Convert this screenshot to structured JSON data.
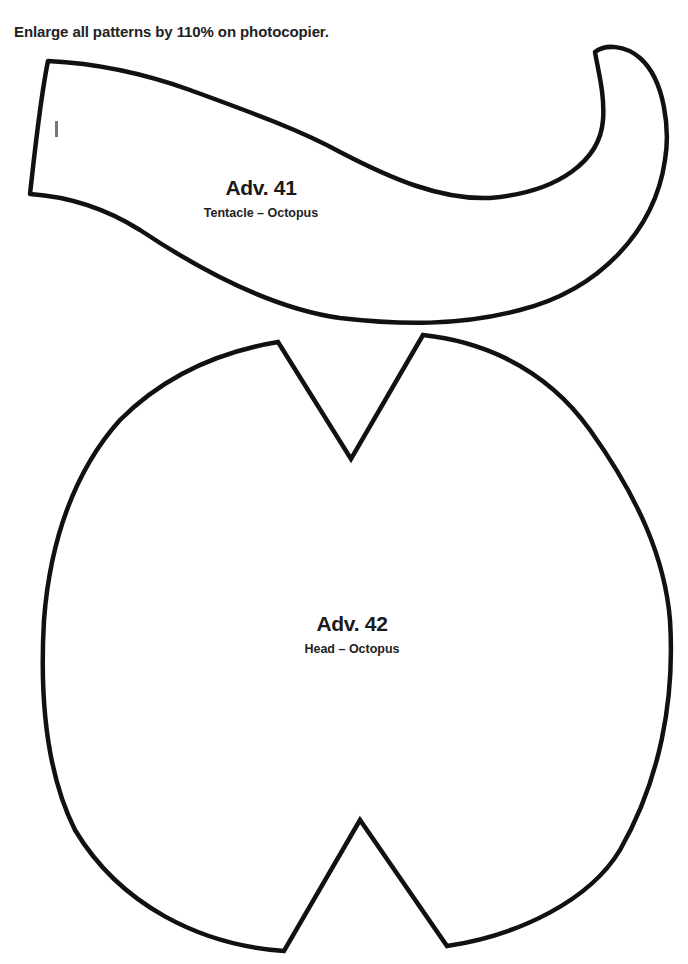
{
  "page": {
    "instruction": "Enlarge all patterns by 110% on photocopier."
  },
  "patterns": [
    {
      "code": "Adv. 41",
      "name": "Tentacle – Octopus"
    },
    {
      "code": "Adv. 42",
      "name": "Head – Octopus"
    }
  ],
  "colors": {
    "outline": "#111111",
    "background": "#ffffff",
    "mark": "#777777"
  }
}
